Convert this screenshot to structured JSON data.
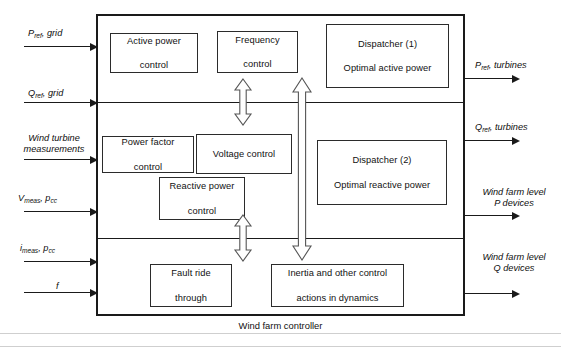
{
  "diagram": {
    "caption": "Wind farm controller",
    "frame_color": "#1a1a1a",
    "block_border_color": "#2b2b2b",
    "background": "#ffffff"
  },
  "inputs": [
    {
      "id": "p-ref-grid",
      "main": "P",
      "sub": "ref",
      "rest": ", grid"
    },
    {
      "id": "q-ref-grid",
      "main": "Q",
      "sub": "ref",
      "rest": ", grid"
    },
    {
      "id": "wind-turbine-measurements",
      "line1": "Wind turbine",
      "line2": "measurements"
    },
    {
      "id": "v-meas-pcc",
      "main": "V",
      "sub": "meas",
      "rest": ", p",
      "sub2": "cc"
    },
    {
      "id": "i-meas-pcc",
      "main": "i",
      "sub": "meas",
      "rest": ", p",
      "sub2": "cc"
    },
    {
      "id": "frequency-f",
      "main": "f",
      "sub": "",
      "rest": ""
    }
  ],
  "outputs": [
    {
      "id": "p-ref-turbines",
      "main": "P",
      "sub": "ref",
      "rest": ", turbines"
    },
    {
      "id": "q-ref-turbines",
      "main": "Q",
      "sub": "ref",
      "rest": ", turbines"
    },
    {
      "id": "wind-farm-level-p-devices",
      "line1": "Wind farm level",
      "line2": "P devices"
    },
    {
      "id": "wind-farm-level-q-devices",
      "line1": "Wind farm level",
      "line2": "Q devices"
    }
  ],
  "blocks": {
    "active_power_control": {
      "line1": "Active power",
      "line2": "control"
    },
    "frequency_control": {
      "line1": "Frequency",
      "line2": "control"
    },
    "dispatcher_1": {
      "line1": "Dispatcher (1)",
      "line2": "Optimal active power"
    },
    "power_factor_control": {
      "line1": "Power factor",
      "line2": "control"
    },
    "voltage_control": {
      "line1": "Voltage control",
      "line2": ""
    },
    "reactive_power_control": {
      "line1": "Reactive power",
      "line2": "control"
    },
    "dispatcher_2": {
      "line1": "Dispatcher (2)",
      "line2": "Optimal reactive power"
    },
    "fault_ride_through": {
      "line1": "Fault ride",
      "line2": "through"
    },
    "inertia_control": {
      "line1": "Inertia and other control",
      "line2": "actions in dynamics"
    }
  },
  "connectors": {
    "arrow_upper_short": "vertical-double-arrow",
    "arrow_lower_short": "vertical-double-arrow",
    "arrow_full_span": "vertical-double-arrow"
  }
}
